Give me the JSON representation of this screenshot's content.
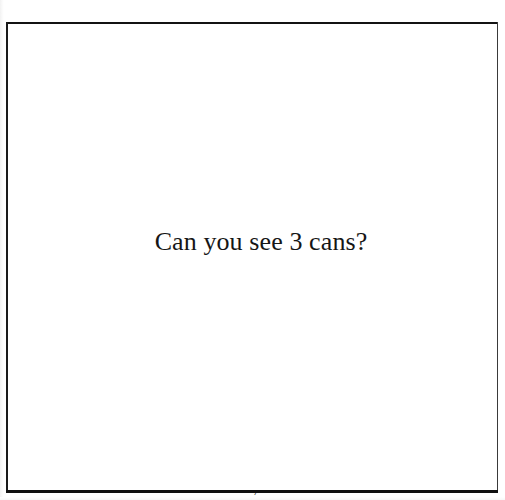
{
  "page": {
    "type": "scanned-book-page",
    "background_color": "#ffffff",
    "text_color": "#161616",
    "border_color": "#131313"
  },
  "figure": {
    "frame_label": "illustration-frame",
    "caption": "Can you see 3 cans?"
  },
  "folio": {
    "number": "7"
  }
}
